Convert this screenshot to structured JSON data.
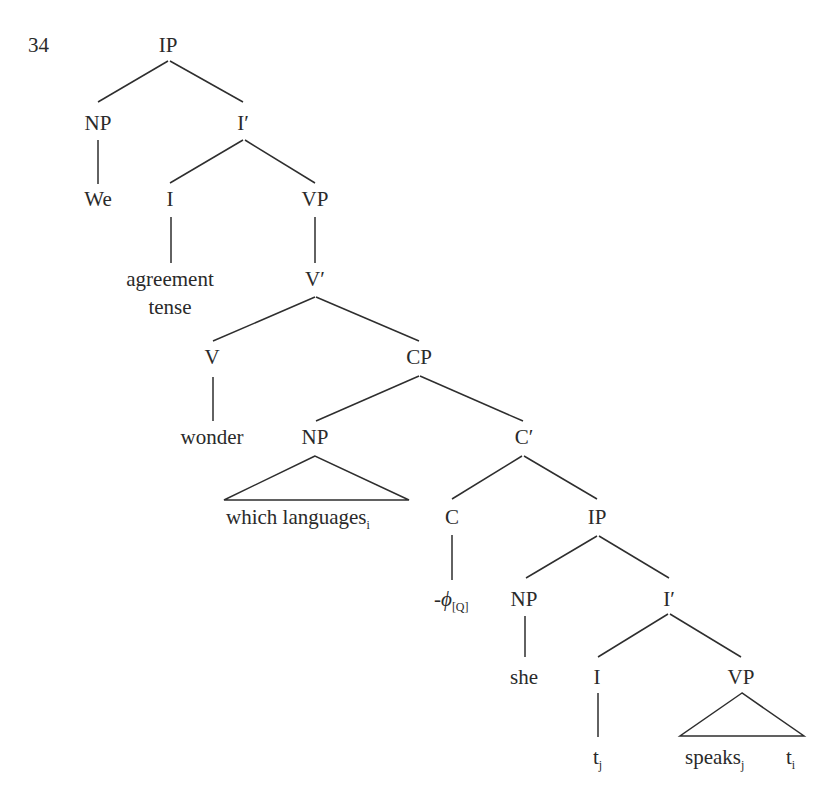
{
  "example_number": "34",
  "tree": {
    "nodes": [
      {
        "id": "ip1",
        "label": "IP",
        "x": 168,
        "y": 52
      },
      {
        "id": "np1",
        "label": "NP",
        "x": 98,
        "y": 130
      },
      {
        "id": "ibar1",
        "label": "I′",
        "x": 243,
        "y": 130
      },
      {
        "id": "we",
        "label": "We",
        "x": 98,
        "y": 206
      },
      {
        "id": "i1",
        "label": "I",
        "x": 170,
        "y": 206
      },
      {
        "id": "vp1",
        "label": "VP",
        "x": 315,
        "y": 206
      },
      {
        "id": "agr1",
        "label": "agreement",
        "x": 170,
        "y": 286
      },
      {
        "id": "agr2",
        "label": "tense",
        "x": 170,
        "y": 314
      },
      {
        "id": "vbar",
        "label": "V′",
        "x": 315,
        "y": 286
      },
      {
        "id": "v",
        "label": "V",
        "x": 212,
        "y": 364
      },
      {
        "id": "cp",
        "label": "CP",
        "x": 419,
        "y": 364
      },
      {
        "id": "wonder",
        "label": "wonder",
        "x": 212,
        "y": 444
      },
      {
        "id": "np2",
        "label": "NP",
        "x": 315,
        "y": 444
      },
      {
        "id": "cbar",
        "label": "C′",
        "x": 524,
        "y": 444
      },
      {
        "id": "whichlang",
        "label": "which languages",
        "sub": "i",
        "x": 300,
        "y": 524
      },
      {
        "id": "c",
        "label": "C",
        "x": 452,
        "y": 524
      },
      {
        "id": "ip2",
        "label": "IP",
        "x": 597,
        "y": 524
      },
      {
        "id": "phi",
        "label": "-ϕ",
        "sub": "[Q]",
        "x": 452,
        "y": 606
      },
      {
        "id": "np3",
        "label": "NP",
        "x": 524,
        "y": 606
      },
      {
        "id": "ibar2",
        "label": "I′",
        "x": 669,
        "y": 606
      },
      {
        "id": "she",
        "label": "she",
        "x": 524,
        "y": 684
      },
      {
        "id": "i2",
        "label": "I",
        "x": 597,
        "y": 684
      },
      {
        "id": "vp2",
        "label": "VP",
        "x": 741,
        "y": 684
      },
      {
        "id": "tj",
        "label": "t",
        "sub": "j",
        "x": 597,
        "y": 764
      },
      {
        "id": "speaks",
        "label": "speaks",
        "sub": "j",
        "x": 696,
        "y": 764
      },
      {
        "id": "ti",
        "label": "t",
        "sub": "i",
        "x": 792,
        "y": 764
      }
    ],
    "edges": [
      [
        "ip1",
        "np1"
      ],
      [
        "ip1",
        "ibar1"
      ],
      [
        "np1",
        "we"
      ],
      [
        "ibar1",
        "i1"
      ],
      [
        "ibar1",
        "vp1"
      ],
      [
        "i1",
        "agr1"
      ],
      [
        "vp1",
        "vbar"
      ],
      [
        "vbar",
        "v"
      ],
      [
        "vbar",
        "cp"
      ],
      [
        "v",
        "wonder"
      ],
      [
        "cp",
        "np2"
      ],
      [
        "cp",
        "cbar"
      ],
      [
        "cbar",
        "c"
      ],
      [
        "cbar",
        "ip2"
      ],
      [
        "c",
        "phi"
      ],
      [
        "ip2",
        "np3"
      ],
      [
        "ip2",
        "ibar2"
      ],
      [
        "np3",
        "she"
      ],
      [
        "ibar2",
        "i2"
      ],
      [
        "ibar2",
        "vp2"
      ],
      [
        "i2",
        "tj"
      ]
    ],
    "triangles": [
      {
        "parent": "np2",
        "covers": "which languages"
      },
      {
        "parent": "vp2",
        "covers": "speaks t"
      }
    ]
  }
}
